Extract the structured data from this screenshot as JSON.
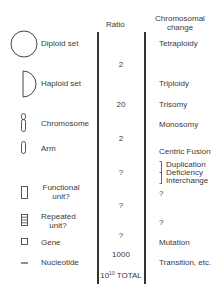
{
  "headers": {
    "ratio": "Ratio",
    "change": "Chromosomal\nchange"
  },
  "levels": [
    {
      "label": "Diploid set",
      "icon": "circle-icon"
    },
    {
      "label": "Haploid set",
      "icon": "half-circle-icon"
    },
    {
      "label": "Chromosome",
      "icon": "chromosome-icon"
    },
    {
      "label": "Arm",
      "icon": "chromosome-arm-icon"
    },
    {
      "label": "Functional\nunit?",
      "icon": "rectangle-icon"
    },
    {
      "label": "Repeated\nunit?",
      "icon": "striped-rectangle-icon"
    },
    {
      "label": "Gene",
      "icon": "small-square-icon"
    },
    {
      "label": "Nucleotide",
      "icon": "dash-icon"
    }
  ],
  "ratios": [
    "2",
    "20",
    "2",
    "?",
    "?",
    "?",
    "1000"
  ],
  "total": {
    "base": "10",
    "exponent": "10",
    "label": "TOTAL"
  },
  "changes": {
    "tetraploidy": "Tetraploidy",
    "triploidy": "Triploidy",
    "trisomy": "Trisomy",
    "monosomy": "Monosomy",
    "centric_fusion": "Centric Fusion",
    "bracket_items": [
      "Duplication",
      "Deficiency",
      "Interchange"
    ],
    "functional_unknown": "?",
    "repeated_unknown": "?",
    "mutation": "Mutation",
    "transition": "Transition, etc."
  }
}
